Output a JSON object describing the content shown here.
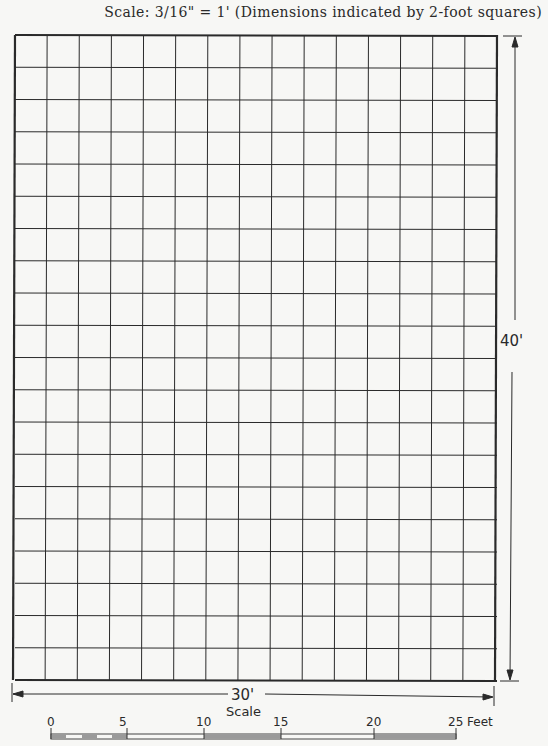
{
  "title": "Scale:  3/16\" = 1'  (Dimensions indicated by 2-foot squares)",
  "grid": {
    "columns": 15,
    "rows": 20,
    "square_size_ft": 2,
    "line_color": "#2a2a2a",
    "background": "#f7f7f5"
  },
  "dimensions": {
    "width_label": "30'",
    "height_label": "40'"
  },
  "scale_bar": {
    "title": "Scale",
    "ticks": [
      "0",
      "5",
      "10",
      "15",
      "20",
      "25"
    ],
    "unit": "Feet",
    "end_label": "25 Feet"
  }
}
